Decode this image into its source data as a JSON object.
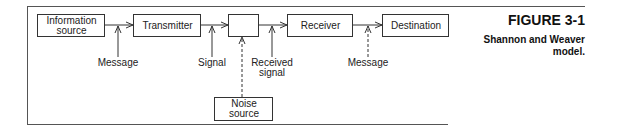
{
  "figure": {
    "number": "FIGURE 3-1",
    "caption": "Shannon and Weaver model."
  },
  "nodes": {
    "information_source": "Information source",
    "information_source_line1": "Information",
    "information_source_line2": "source",
    "transmitter": "Transmitter",
    "channel": "",
    "receiver": "Receiver",
    "destination": "Destination",
    "noise_source_line1": "Noise",
    "noise_source_line2": "source"
  },
  "labels": {
    "message_1": "Message",
    "signal": "Signal",
    "received_signal_line1": "Received",
    "received_signal_line2": "signal",
    "message_2": "Message"
  },
  "colors": {
    "line": "#333333",
    "frame": "#555555"
  }
}
